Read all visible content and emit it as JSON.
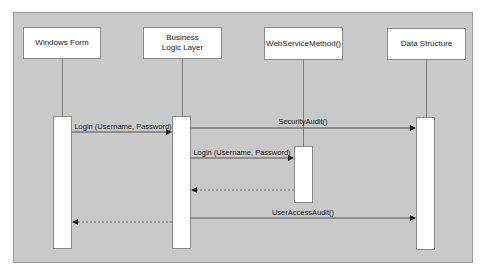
{
  "diagram": {
    "type": "sequence",
    "colors": {
      "frame_bg": "#c9c9c9",
      "box_bg": "#ffffff",
      "line": "#555555"
    },
    "participants": [
      {
        "id": "wf",
        "label": "Windows Form"
      },
      {
        "id": "bll",
        "label": "Business Logic Layer"
      },
      {
        "id": "ws",
        "label": "WebServiceMethod()"
      },
      {
        "id": "ds",
        "label": "Data Structure"
      }
    ],
    "messages": [
      {
        "from": "wf",
        "to": "bll",
        "label": "Login (Username, Password)",
        "style": "solid"
      },
      {
        "from": "bll",
        "to": "ds",
        "label": "SecurityAudit()",
        "style": "solid"
      },
      {
        "from": "bll",
        "to": "ws",
        "label": "Login (Username, Password)",
        "style": "solid"
      },
      {
        "from": "ws",
        "to": "bll",
        "label": "",
        "style": "dashed"
      },
      {
        "from": "bll",
        "to": "ds",
        "label": "UserAccessAudit()",
        "style": "solid"
      },
      {
        "from": "bll",
        "to": "wf",
        "label": "",
        "style": "dashed"
      }
    ]
  }
}
